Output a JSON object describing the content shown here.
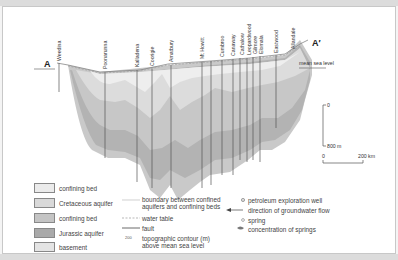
{
  "diagram": {
    "start_label": "A",
    "end_label": "A′",
    "sea_level_label": "mean sea level",
    "stations": [
      "Weedina",
      "Poonarunna",
      "Kalladena",
      "Coorigie",
      "Amatbury",
      "Mt Howitt",
      "Cumbroo",
      "Canaway",
      "Cathalow",
      "Leopardwood",
      "Gilmore",
      "Elomala",
      "Eastwood",
      "Allandale"
    ],
    "vertical_scale": {
      "top": "0",
      "bottom": "800 m"
    },
    "horizontal_scale": {
      "left": "0",
      "right": "200 km"
    }
  },
  "legend": {
    "layers": [
      {
        "label": "confining bed",
        "color": "#ebebeb"
      },
      {
        "label": "Cretaceous aquifer",
        "color": "#d9d9d9"
      },
      {
        "label": "confining bed",
        "color": "#c4c4c4"
      },
      {
        "label": "Jurassic aquifer",
        "color": "#a9a9a9"
      },
      {
        "label": "basement",
        "color": "#e4e4e4"
      }
    ],
    "lines": [
      {
        "label": "boundary between confined aquifers and confining beds"
      },
      {
        "label": "water table"
      },
      {
        "label": "fault"
      },
      {
        "label": "topographic contour (m) above mean sea level",
        "sample": "200"
      }
    ],
    "symbols": [
      {
        "label": "petroleum exploration well"
      },
      {
        "label": "direction of groundwater flow"
      },
      {
        "label": "spring"
      },
      {
        "label": "concentration of springs"
      }
    ]
  }
}
